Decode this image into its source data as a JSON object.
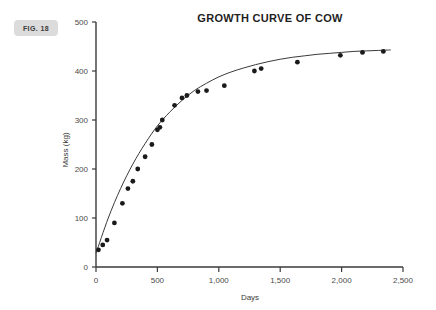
{
  "figure": {
    "badge_label": "FIG. 18"
  },
  "chart_data": {
    "type": "scatter",
    "title": "GROWTH CURVE OF COW",
    "xlabel": "Days",
    "ylabel": "Mass (kg)",
    "xlim": [
      0,
      2500
    ],
    "ylim": [
      0,
      500
    ],
    "x_ticks": [
      0,
      500,
      1000,
      1500,
      2000,
      2500
    ],
    "x_tick_labels": [
      "0",
      "500",
      "1,000",
      "1,500",
      "2,000",
      "2,500"
    ],
    "y_ticks": [
      0,
      100,
      200,
      300,
      400,
      500
    ],
    "y_tick_labels": [
      "0",
      "100",
      "200",
      "300",
      "400",
      "500"
    ],
    "grid": false,
    "legend": null,
    "marker_color": "#1a1a1a",
    "line_color": "#3a3a3a",
    "axis_color": "#3a3a3a",
    "background_color": "#ffffff",
    "series": [
      {
        "name": "Observed mass",
        "type": "scatter",
        "points": [
          [
            20,
            35
          ],
          [
            55,
            45
          ],
          [
            90,
            55
          ],
          [
            150,
            90
          ],
          [
            215,
            130
          ],
          [
            260,
            160
          ],
          [
            300,
            175
          ],
          [
            340,
            200
          ],
          [
            400,
            225
          ],
          [
            455,
            250
          ],
          [
            500,
            280
          ],
          [
            520,
            285
          ],
          [
            540,
            300
          ],
          [
            640,
            330
          ],
          [
            700,
            345
          ],
          [
            740,
            350
          ],
          [
            830,
            358
          ],
          [
            900,
            360
          ],
          [
            1045,
            370
          ],
          [
            1290,
            400
          ],
          [
            1345,
            405
          ],
          [
            1640,
            418
          ],
          [
            1990,
            432
          ],
          [
            2170,
            438
          ],
          [
            2340,
            440
          ]
        ]
      },
      {
        "name": "Fitted growth curve",
        "type": "line",
        "asymptote": 455,
        "rate_constant": 0.0018,
        "offset_days": -10,
        "points": [
          [
            0,
            28
          ],
          [
            100,
            100
          ],
          [
            200,
            160
          ],
          [
            300,
            210
          ],
          [
            400,
            252
          ],
          [
            500,
            288
          ],
          [
            600,
            316
          ],
          [
            700,
            340
          ],
          [
            800,
            360
          ],
          [
            900,
            375
          ],
          [
            1000,
            388
          ],
          [
            1100,
            398
          ],
          [
            1200,
            406
          ],
          [
            1300,
            413
          ],
          [
            1400,
            419
          ],
          [
            1500,
            424
          ],
          [
            1600,
            428
          ],
          [
            1700,
            431
          ],
          [
            1800,
            434
          ],
          [
            1900,
            436
          ],
          [
            2000,
            438
          ],
          [
            2100,
            440
          ],
          [
            2200,
            441
          ],
          [
            2300,
            442
          ],
          [
            2400,
            443
          ]
        ]
      }
    ]
  }
}
